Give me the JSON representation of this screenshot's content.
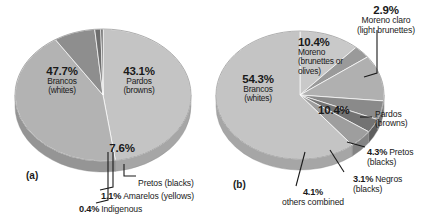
{
  "figure": {
    "background": "#ffffff",
    "panels": [
      {
        "tag": "(a)",
        "tag_pos": {
          "x": 26,
          "y": 172
        },
        "center": {
          "x": 103,
          "y": 95
        },
        "radius_x": 88,
        "radius_y": 66,
        "depth": 11,
        "start_angle_deg": -90,
        "slices": [
          {
            "name": "Brancos",
            "translation": "(whites)",
            "percent": 47.7,
            "percent_label": "47.7%",
            "color": "#c4c4c4",
            "side_color": "#a6a6a6"
          },
          {
            "name": "Pardos",
            "translation": "(browns)",
            "percent": 43.1,
            "percent_label": "43.1%",
            "color": "#b3b3b3",
            "side_color": "#959595"
          },
          {
            "name": "Pretos",
            "translation": "(blacks)",
            "percent": 7.6,
            "percent_label": "7.6%",
            "color": "#8e8e8e",
            "side_color": "#757575"
          },
          {
            "name": "Amarelos",
            "translation": "(yellows)",
            "percent": 1.1,
            "percent_label": "1.1%",
            "color": "#6e6e6e",
            "side_color": "#5a5a5a"
          },
          {
            "name": "Indigenous",
            "translation": "",
            "percent": 0.4,
            "percent_label": "0.4%",
            "color": "#555555",
            "side_color": "#444444"
          }
        ],
        "inside_labels": [
          {
            "percent": "47.7%",
            "name": "Brancos",
            "translation": "(whites)",
            "x": 62,
            "y": 72
          },
          {
            "percent": "43.1%",
            "name": "Pardos",
            "translation": "(browns)",
            "x": 137,
            "y": 72
          }
        ],
        "callouts": [
          {
            "percent": "7.6%",
            "name": "",
            "translation": "",
            "x": 120,
            "y": 148
          },
          {
            "percent": "",
            "name": "Pretos (blacks)",
            "translation": "",
            "x": 138,
            "y": 181
          },
          {
            "percent": "1.1%",
            "name": "Amarelos (yellows)",
            "translation": "",
            "x": 101,
            "y": 194
          },
          {
            "percent": "0.4%",
            "name": "Indigenous",
            "translation": "",
            "x": 79,
            "y": 207
          }
        ]
      },
      {
        "tag": "(b)",
        "tag_pos": {
          "x": 233,
          "y": 181
        },
        "center": {
          "x": 300,
          "y": 95
        },
        "radius_x": 84,
        "radius_y": 64,
        "depth": 11,
        "start_angle_deg": -90,
        "slices": [
          {
            "name": "Moreno",
            "translation": "(brunettes or olives)",
            "percent": 10.4,
            "percent_label": "10.4%",
            "color": "#c9c9c9",
            "side_color": "#aaaaaa"
          },
          {
            "name": "Moreno claro",
            "translation": "(light brunettes)",
            "percent": 2.9,
            "percent_label": "2.9%",
            "color": "#9a9a9a",
            "side_color": "#808080"
          },
          {
            "name": "Pardos",
            "translation": "(browns)",
            "percent": 10.4,
            "percent_label": "10.4%",
            "color": "#b0b0b0",
            "side_color": "#909090"
          },
          {
            "name": "Pretos",
            "translation": "(blacks)",
            "percent": 4.3,
            "percent_label": "4.3%",
            "color": "#8a8a8a",
            "side_color": "#717171"
          },
          {
            "name": "Negros",
            "translation": "(blacks)",
            "percent": 3.1,
            "percent_label": "3.1%",
            "color": "#737373",
            "side_color": "#5e5e5e"
          },
          {
            "name": "others combined",
            "translation": "",
            "percent": 4.1,
            "percent_label": "4.1%",
            "color": "#9e9e9e",
            "side_color": "#848484"
          },
          {
            "name": "Brancos",
            "translation": "(whites)",
            "percent": 54.3,
            "percent_label": "54.3%",
            "color": "#c4c4c4",
            "side_color": "#a6a6a6"
          }
        ],
        "inside_labels": [
          {
            "percent": "54.3%",
            "name": "Brancos",
            "translation": "(whites)",
            "x": 258,
            "y": 80
          },
          {
            "percent": "10.4%",
            "name": "Moreno",
            "translation": "(brunettes or olives)",
            "x": 303,
            "y": 43
          },
          {
            "percent": "10.4%",
            "name": "",
            "translation": "",
            "x": 330,
            "y": 106
          }
        ],
        "callouts": [
          {
            "percent": "2.9%",
            "name": "Moreno claro",
            "translation": "(light brunettes)",
            "x": 343,
            "y": 5
          },
          {
            "percent": "",
            "name": "Pardos",
            "translation": "(browns)",
            "x": 374,
            "y": 111
          },
          {
            "percent": "4.3%",
            "name": "Pretos",
            "translation": "(blacks)",
            "x": 367,
            "y": 143
          },
          {
            "percent": "3.1%",
            "name": "Negros",
            "translation": "(blacks)",
            "x": 355,
            "y": 170
          },
          {
            "percent": "4.1%",
            "name": "others combined",
            "translation": "",
            "x": 281,
            "y": 192
          }
        ]
      }
    ]
  },
  "chart_data": [
    {
      "type": "pie",
      "title": "(a)",
      "categories": [
        "Brancos (whites)",
        "Pardos (browns)",
        "Pretos (blacks)",
        "Amarelos (yellows)",
        "Indigenous"
      ],
      "values": [
        47.7,
        43.1,
        7.6,
        1.1,
        0.4
      ],
      "value_labels": [
        "47.7%",
        "43.1%",
        "7.6%",
        "1.1%",
        "0.4%"
      ],
      "colors": [
        "#c4c4c4",
        "#b3b3b3",
        "#8e8e8e",
        "#6e6e6e",
        "#555555"
      ],
      "units": "percent",
      "legend": "none",
      "labels_inside": [
        "47.7% Brancos (whites)",
        "43.1% Pardos (browns)",
        "7.6%"
      ],
      "labels_callout": [
        "Pretos (blacks)",
        "1.1% Amarelos (yellows)",
        "0.4% Indigenous"
      ]
    },
    {
      "type": "pie",
      "title": "(b)",
      "categories": [
        "Brancos (whites)",
        "Moreno (brunettes or olives)",
        "Moreno claro (light brunettes)",
        "Pardos (browns)",
        "Pretos (blacks)",
        "Negros (blacks)",
        "others combined"
      ],
      "values": [
        54.3,
        10.4,
        2.9,
        10.4,
        4.3,
        3.1,
        4.1
      ],
      "value_labels": [
        "54.3%",
        "10.4%",
        "2.9%",
        "10.4%",
        "4.3%",
        "3.1%",
        "4.1%"
      ],
      "colors": [
        "#c4c4c4",
        "#c9c9c9",
        "#9a9a9a",
        "#b0b0b0",
        "#8a8a8a",
        "#737373",
        "#9e9e9e"
      ],
      "units": "percent",
      "legend": "none",
      "labels_inside": [
        "54.3% Brancos (whites)",
        "10.4% Moreno (brunettes or olives)",
        "10.4%"
      ],
      "labels_callout": [
        "2.9% Moreno claro (light brunettes)",
        "Pardos (browns)",
        "4.3% Pretos (blacks)",
        "3.1% Negros (blacks)",
        "4.1% others combined"
      ]
    }
  ]
}
